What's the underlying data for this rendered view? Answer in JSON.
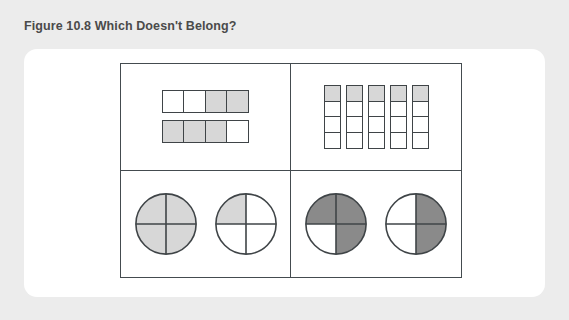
{
  "figure": {
    "caption": "Figure 10.8 Which Doesn't Belong?",
    "caption_color": "#4a4a4a",
    "page_background": "#ececec",
    "card_background": "#ffffff",
    "line_color": "#444b4f"
  },
  "palette": {
    "shade_light": "#d7d7d7",
    "shade_dark": "#8a8a8a",
    "empty": "#ffffff",
    "stroke": "#3f4447"
  },
  "chart_data": {
    "type": "diagram",
    "title": "Figure 10.8 Which Doesn't Belong?",
    "layout": "2x2 grid of fraction representations",
    "quadrants": [
      {
        "id": "top-left",
        "name": "horizontal-bars",
        "representation": "two rows of four unit squares",
        "rows": 2,
        "cols": 4,
        "shade": "light",
        "cells": [
          [
            "empty",
            "empty",
            "shaded",
            "shaded"
          ],
          [
            "shaded",
            "shaded",
            "shaded",
            "empty"
          ]
        ],
        "fractions": [
          "2/4",
          "3/4"
        ]
      },
      {
        "id": "top-right",
        "name": "vertical-strips",
        "representation": "five columns of four unit squares",
        "columns": 5,
        "rows": 4,
        "shade": "light",
        "cells": [
          [
            "shaded",
            "empty",
            "empty",
            "empty"
          ],
          [
            "shaded",
            "empty",
            "empty",
            "empty"
          ],
          [
            "shaded",
            "empty",
            "empty",
            "empty"
          ],
          [
            "shaded",
            "empty",
            "empty",
            "empty"
          ],
          [
            "shaded",
            "empty",
            "empty",
            "empty"
          ]
        ],
        "fractions": [
          "1/4",
          "1/4",
          "1/4",
          "1/4",
          "1/4"
        ]
      },
      {
        "id": "bottom-left",
        "name": "light-circles",
        "representation": "two circles divided into quarters",
        "shade": "light",
        "circles": [
          {
            "label": "circle-1",
            "quarters": [
              "shaded",
              "shaded",
              "shaded",
              "shaded"
            ],
            "fraction": "4/4"
          },
          {
            "label": "circle-2",
            "quarters": [
              "shaded",
              "empty",
              "empty",
              "empty"
            ],
            "fraction": "1/4"
          }
        ]
      },
      {
        "id": "bottom-right",
        "name": "dark-circles",
        "representation": "two circles divided into quarters",
        "shade": "dark",
        "circles": [
          {
            "label": "circle-1",
            "quarters": [
              "shaded",
              "shaded",
              "shaded",
              "empty"
            ],
            "fraction": "3/4"
          },
          {
            "label": "circle-2",
            "quarters": [
              "empty",
              "shaded",
              "shaded",
              "empty"
            ],
            "fraction": "2/4"
          }
        ]
      }
    ],
    "quarter_order": [
      "top-left",
      "top-right",
      "bottom-right",
      "bottom-left"
    ]
  }
}
